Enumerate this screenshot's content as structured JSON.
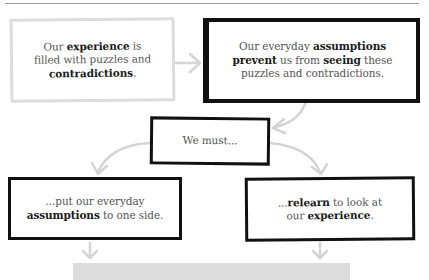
{
  "diagram": {
    "type": "flowchart",
    "boxes": [
      {
        "id": "b1",
        "style": "gray-sketch",
        "lines": [
          [
            {
              "t": "Our ",
              "b": false
            },
            {
              "t": "experience",
              "b": true
            },
            {
              "t": " is",
              "b": false
            }
          ],
          [
            {
              "t": "filled with puzzles and",
              "b": false
            }
          ],
          [
            {
              "t": "contradictions",
              "b": true
            },
            {
              "t": ".",
              "b": false
            }
          ]
        ],
        "text": "Our experience is filled with puzzles and contradictions."
      },
      {
        "id": "b2",
        "style": "black-sketch",
        "lines": [
          [
            {
              "t": "Our everyday ",
              "b": false
            },
            {
              "t": "assumptions",
              "b": true
            }
          ],
          [
            {
              "t": "prevent",
              "b": true
            },
            {
              "t": " us from ",
              "b": false
            },
            {
              "t": "seeing",
              "b": true
            },
            {
              "t": " these",
              "b": false
            }
          ],
          [
            {
              "t": "puzzles and contradictions.",
              "b": false
            }
          ]
        ],
        "text": "Our everyday assumptions prevent us from seeing these puzzles and contradictions."
      },
      {
        "id": "b3",
        "style": "black-sketch",
        "lines": [
          [
            {
              "t": "We must...",
              "b": false
            }
          ]
        ],
        "text": "We must..."
      },
      {
        "id": "b4",
        "style": "black-sketch",
        "lines": [
          [
            {
              "t": "...put our everyday",
              "b": false
            }
          ],
          [
            {
              "t": "assumptions",
              "b": true
            },
            {
              "t": " to one side.",
              "b": false
            }
          ]
        ],
        "text": "...put our everyday assumptions to one side."
      },
      {
        "id": "b5",
        "style": "black-sketch",
        "lines": [
          [
            {
              "t": "...",
              "b": false
            },
            {
              "t": "relearn",
              "b": true
            },
            {
              "t": " to look at",
              "b": false
            }
          ],
          [
            {
              "t": "our ",
              "b": false
            },
            {
              "t": "experience",
              "b": true
            },
            {
              "t": ".",
              "b": false
            }
          ]
        ],
        "text": "...relearn to look at our experience."
      }
    ],
    "edges": [
      {
        "from": "b1",
        "to": "b2"
      },
      {
        "from": "b2",
        "to": "b3"
      },
      {
        "from": "b3",
        "to": "b4"
      },
      {
        "from": "b3",
        "to": "b5"
      },
      {
        "from": "b4",
        "to": "bottom-bar"
      },
      {
        "from": "b5",
        "to": "bottom-bar"
      }
    ],
    "colors": {
      "text": "#555555",
      "bold_text": "#1a1a1a",
      "box_border_black": "#111111",
      "box_border_gray": "#dcdcdc",
      "arrow": "#d4d4d4",
      "bottom_bar": "#dcdcdc",
      "rule": "#9a9a9a"
    }
  }
}
